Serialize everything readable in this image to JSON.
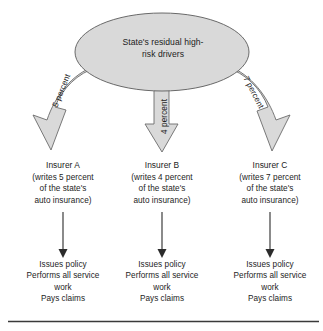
{
  "diagram": {
    "pool": {
      "label": "State's residual high-\nrisk drivers",
      "shape": "ellipse",
      "fill": "#d9d9d9",
      "stroke": "#5a5a5a"
    },
    "flow_labels": [
      {
        "name": "flow-a",
        "text": "5 percent"
      },
      {
        "name": "flow-b",
        "text": "4 percent"
      },
      {
        "name": "flow-c",
        "text": "7 percent"
      }
    ],
    "columns": [
      {
        "key": "a",
        "insurer": "Insurer A",
        "detail": "(writes 5 percent\nof the state's\nauto insurance)",
        "actions": "Issues policy\nPerforms all service\nwork\nPays claims"
      },
      {
        "key": "b",
        "insurer": "Insurer B",
        "detail": "(writes 4 percent\nof the state's\nauto insurance)",
        "actions": "Issues policy\nPerforms all service\nwork\nPays claims"
      },
      {
        "key": "c",
        "insurer": "Insurer C",
        "detail": "(writes 7 percent\nof the state's\nauto insurance)",
        "actions": "Issues policy\nPerforms all service\nwork\nPays claims"
      }
    ],
    "colors": {
      "arrow_fill": "#d9d9d9",
      "arrow_stroke": "#6b6b6b",
      "thin_arrow": "#2b2b2b",
      "text": "#1c1c1c",
      "rule": "#3a3a3a"
    }
  }
}
